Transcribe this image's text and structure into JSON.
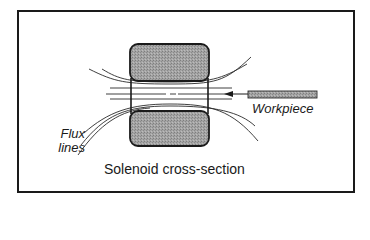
{
  "diagram": {
    "title": "Solenoid cross-section",
    "labels": {
      "flux_line1": "Flux",
      "flux_line2": "lines",
      "workpiece": "Workpiece",
      "caption": "Solenoid cross-section"
    },
    "components": [
      {
        "name": "top-coil",
        "shape": "rounded-rect",
        "fill": "#9a9a9a"
      },
      {
        "name": "bottom-coil",
        "shape": "rounded-rect",
        "fill": "#9a9a9a"
      },
      {
        "name": "workpiece-bar",
        "shape": "rect",
        "fill": "#a8a8a8"
      },
      {
        "name": "arrow",
        "direction": "left",
        "meaning": "workpiece insertion"
      },
      {
        "name": "flux-lines",
        "count": 7
      }
    ],
    "colors": {
      "stroke": "#1a1a1a",
      "coil_fill": "#9a9a9a",
      "workpiece_fill": "#a8a8a8",
      "background": "#ffffff"
    }
  }
}
